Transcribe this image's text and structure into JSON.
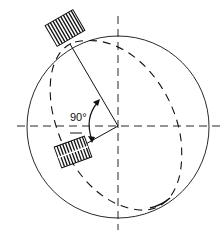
{
  "diagram": {
    "angle_label": "90°",
    "colors": {
      "stroke": "#111111",
      "background": "#ffffff"
    },
    "elements": [
      "outer-circle",
      "dashed-ellipse-path",
      "horizontal-dashed-axis",
      "vertical-dashed-axis",
      "upper-hatched-block",
      "lower-hatched-block",
      "connecting-arm",
      "angle-arc-arrow"
    ]
  }
}
